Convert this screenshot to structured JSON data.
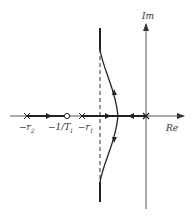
{
  "diagram": {
    "type": "root-locus",
    "axes": {
      "real_label": "Re",
      "imag_label": "Im"
    },
    "poles": [
      {
        "label": "-r2",
        "text": "−r",
        "sub": "2",
        "marker": "x"
      },
      {
        "label": "-r1",
        "text": "−r",
        "sub": "1",
        "marker": "x"
      },
      {
        "label": "origin",
        "marker": "x"
      }
    ],
    "zeros": [
      {
        "label": "-1/T_I",
        "text": "−1/T",
        "sub": "I",
        "marker": "o"
      }
    ],
    "asymptote": {
      "style": "dashed",
      "orientation": "vertical"
    },
    "colors": {
      "line": "#222222",
      "axis": "#444444",
      "background": "#ffffff"
    }
  }
}
